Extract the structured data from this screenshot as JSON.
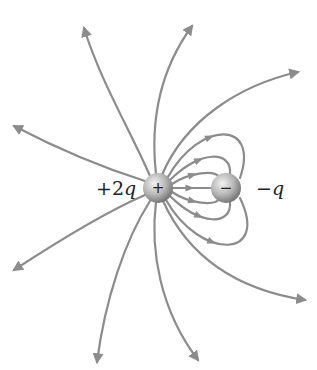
{
  "diagram": {
    "colors": {
      "line": "#8c8c8c",
      "arrow": "#8c8c8c",
      "sphere_light": "#e6e6e6",
      "sphere_dark": "#7a7a7a",
      "text": "#222222"
    },
    "charges": [
      {
        "id": "positive",
        "sign": "+",
        "label_num": "+2",
        "label_var": "q",
        "cx": 158,
        "cy": 188,
        "r": 15
      },
      {
        "id": "negative",
        "sign": "−",
        "label_num": "−",
        "label_var": "q",
        "cx": 226,
        "cy": 188,
        "r": 15
      }
    ],
    "outer_lines": [
      {
        "d": "M150,176 C130,130 100,80 84,28"
      },
      {
        "d": "M156,174 C150,120 160,70 192,26"
      },
      {
        "d": "M162,175 C185,120 240,85 298,72"
      },
      {
        "d": "M145,181 C110,170 60,150 14,126"
      },
      {
        "d": "M145,195 C110,210 60,240 14,270"
      },
      {
        "d": "M150,201 C125,240 105,300 97,362"
      },
      {
        "d": "M156,202 C150,250 160,310 198,360"
      },
      {
        "d": "M163,201 C190,260 240,290 305,300"
      }
    ],
    "inner_lines": [
      {
        "d": "M168,177 C200,120 260,120 240,178"
      },
      {
        "d": "M170,180 C200,150 232,150 230,174"
      },
      {
        "d": "M172,184 C190,172 215,170 219,177"
      },
      {
        "d": "M173,188 L211,188"
      },
      {
        "d": "M172,192 C190,204 215,206 219,199"
      },
      {
        "d": "M170,196 C200,226 232,226 230,202"
      },
      {
        "d": "M166,200 C200,260 270,260 240,198"
      }
    ]
  }
}
